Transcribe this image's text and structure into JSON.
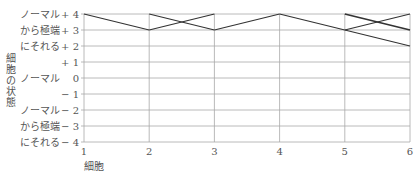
{
  "chart_data": {
    "type": "line",
    "title": "",
    "xlabel": "細胞",
    "ylabel": "細胞の状態",
    "x": [
      1,
      2,
      3,
      4,
      5,
      6
    ],
    "x_tick_labels": [
      "1",
      "2",
      "3",
      "4",
      "5",
      "6"
    ],
    "ylim": [
      -4,
      4
    ],
    "y_ticks": [
      4,
      3,
      2,
      1,
      0,
      -1,
      -2,
      -3,
      -4
    ],
    "y_tick_labels": [
      "+ 4",
      "+ 3",
      "+ 2",
      "+ 1",
      "0",
      "− 1",
      "− 2",
      "− 3",
      "− 4"
    ],
    "y_category_labels": [
      {
        "text": [
          "ノーマル",
          "から極端",
          "にそれる"
        ],
        "range": [
          2,
          4
        ]
      },
      {
        "text": [
          "ノーマル"
        ],
        "range": [
          0,
          0
        ]
      },
      {
        "text": [
          "ノーマル",
          "から極端",
          "にそれる"
        ],
        "range": [
          -4,
          -2
        ]
      }
    ],
    "grid": true,
    "segments": [
      {
        "from": [
          1,
          4
        ],
        "to": [
          2,
          3
        ],
        "weight": "normal"
      },
      {
        "from": [
          2,
          4
        ],
        "to": [
          3,
          3
        ],
        "weight": "normal"
      },
      {
        "from": [
          2,
          3
        ],
        "to": [
          3,
          4
        ],
        "weight": "normal"
      },
      {
        "from": [
          3,
          3
        ],
        "to": [
          4,
          4
        ],
        "weight": "normal"
      },
      {
        "from": [
          4,
          4
        ],
        "to": [
          5,
          3
        ],
        "weight": "normal"
      },
      {
        "from": [
          5,
          4
        ],
        "to": [
          6,
          3
        ],
        "weight": "thick"
      },
      {
        "from": [
          5,
          3
        ],
        "to": [
          6,
          4
        ],
        "weight": "normal"
      },
      {
        "from": [
          5,
          3
        ],
        "to": [
          6,
          2
        ],
        "weight": "normal"
      }
    ]
  }
}
